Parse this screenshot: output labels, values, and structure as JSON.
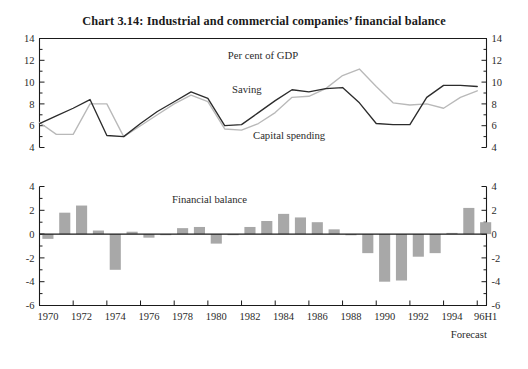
{
  "title": "Chart 3.14: Industrial and commercial companies’ financial balance",
  "annotations": {
    "percent_of_gdp": "Per cent of GDP",
    "saving": "Saving",
    "capital_spending": "Capital spending",
    "financial_balance": "Financial balance",
    "forecast": "Forecast"
  },
  "colors": {
    "saving_line": "#2c2c2c",
    "capital_line": "#b9b9b9",
    "bar_fill": "#a8a8a8",
    "axis": "#1a1a1a",
    "background": "#ffffff"
  },
  "chart_data": [
    {
      "type": "line",
      "title": "Industrial and commercial companies’ saving and capital spending",
      "subtitle": "Per cent of GDP",
      "xlabel": "",
      "ylabel": "Per cent of GDP",
      "ylim": [
        4,
        14
      ],
      "yticks": [
        4,
        6,
        8,
        10,
        12,
        14
      ],
      "ytick_labels_left": [
        "4",
        "6",
        "8",
        "10",
        "12",
        "14"
      ],
      "ytick_labels_right": [
        "4",
        "6",
        "8",
        "10",
        "12",
        "14"
      ],
      "grid": false,
      "legend": "inline-annotations",
      "x": [
        1970,
        1971,
        1972,
        1973,
        1974,
        1975,
        1976,
        1977,
        1978,
        1979,
        1980,
        1981,
        1982,
        1983,
        1984,
        1985,
        1986,
        1987,
        1988,
        1989,
        1990,
        1991,
        1992,
        1993,
        1994,
        1995,
        1996
      ],
      "xtick_labels": [
        "1970",
        "1972",
        "1974",
        "1976",
        "1978",
        "1980",
        "1982",
        "1984",
        "1986",
        "1988",
        "1990",
        "1992",
        "1994",
        "96H1"
      ],
      "series": [
        {
          "name": "Saving",
          "color": "#2c2c2c",
          "values": [
            6.2,
            6.9,
            7.6,
            8.4,
            5.1,
            5.0,
            6.2,
            7.3,
            8.2,
            9.1,
            8.5,
            6.0,
            6.1,
            7.2,
            8.3,
            9.3,
            9.1,
            9.4,
            9.5,
            8.1,
            6.2,
            6.1,
            6.1,
            8.6,
            9.7,
            9.7,
            9.6
          ]
        },
        {
          "name": "Capital spending",
          "color": "#b9b9b9",
          "values": [
            6.3,
            5.2,
            5.2,
            8.0,
            8.0,
            5.0,
            6.0,
            7.0,
            8.0,
            8.8,
            8.2,
            5.7,
            5.6,
            6.2,
            7.2,
            8.6,
            8.7,
            9.4,
            10.6,
            11.2,
            9.6,
            8.1,
            7.9,
            8.0,
            7.6,
            8.6,
            9.2
          ]
        }
      ]
    },
    {
      "type": "bar",
      "title": "Financial balance",
      "xlabel": "",
      "ylabel": "Per cent of GDP",
      "ylim": [
        -6,
        4
      ],
      "yticks": [
        -6,
        -4,
        -2,
        0,
        2,
        4
      ],
      "ytick_labels_left": [
        "4",
        "2",
        "0",
        "-2",
        "-4",
        "-6"
      ],
      "ytick_labels_right": [
        "4",
        "2",
        "0",
        "-2",
        "-4",
        "-6"
      ],
      "grid": false,
      "categories": [
        1970,
        1971,
        1972,
        1973,
        1974,
        1975,
        1976,
        1977,
        1978,
        1979,
        1980,
        1981,
        1982,
        1983,
        1984,
        1985,
        1986,
        1987,
        1988,
        1989,
        1990,
        1991,
        1992,
        1993,
        1994,
        1995,
        1996
      ],
      "xtick_labels": [
        "1970",
        "1972",
        "1974",
        "1976",
        "1978",
        "1980",
        "1982",
        "1984",
        "1986",
        "1988",
        "1990",
        "1992",
        "1994",
        "96H1"
      ],
      "values": [
        -0.4,
        1.8,
        2.4,
        0.3,
        -3.0,
        0.2,
        -0.3,
        0.0,
        0.5,
        0.6,
        -0.8,
        0.0,
        0.6,
        1.1,
        1.7,
        1.4,
        1.0,
        0.4,
        -0.1,
        -1.6,
        -4.0,
        -3.9,
        -1.9,
        -1.6,
        0.1,
        2.2,
        1.0,
        0.4
      ],
      "bar_color": "#a8a8a8"
    }
  ]
}
